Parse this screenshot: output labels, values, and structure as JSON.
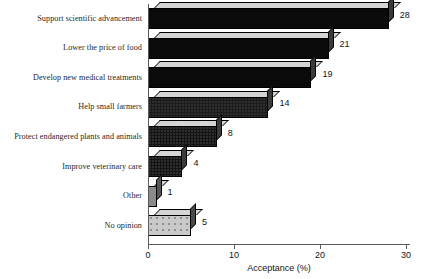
{
  "chart_data": {
    "type": "bar",
    "orientation": "horizontal",
    "title": "",
    "xlabel": "Acceptance (%)",
    "ylabel": "",
    "xlim": [
      0,
      30
    ],
    "xticks": [
      0,
      10,
      20,
      30
    ],
    "xtick_labels": [
      "0",
      "10",
      "20",
      "30"
    ],
    "grid": false,
    "legend": false,
    "style": "3d-extruded-bars",
    "categories": [
      "Support scientific advancement",
      "Lower the price of food",
      "Develop new medical treatments",
      "Help small farmers",
      "Protect endangered plants and animals",
      "Improve veterinary care",
      "Other",
      "No opinion"
    ],
    "values": [
      28,
      21,
      19,
      14,
      8,
      4,
      1,
      5
    ],
    "value_labels": [
      "28",
      "21",
      "19",
      "14",
      "8",
      "4",
      "1",
      "5"
    ],
    "bar_fills": [
      "#0a0a0a",
      "#0a0a0a",
      "#0a0a0a",
      "#1c1c1c",
      "#141414",
      "#141414",
      "#8a8a8a",
      "#c9c9c9"
    ],
    "bar_top_fills": [
      "#d4d4d4",
      "#d4d4d4",
      "#d4d4d4",
      "#d4d4d4",
      "#d4d4d4",
      "#d4d4d4",
      "#d4d4d4",
      "#d4d4d4"
    ],
    "bar_side_fills": [
      "#3a3a3a",
      "#3a3a3a",
      "#3a3a3a",
      "#3a3a3a",
      "#3a3a3a",
      "#3a3a3a",
      "#555555",
      "#4a4a4a"
    ]
  },
  "colors": {
    "background": "#ffffff",
    "axis": "#5a5a5a",
    "text": "#141414",
    "bar_dark": "#0a0a0a",
    "bar_light": "#c9c9c9"
  }
}
